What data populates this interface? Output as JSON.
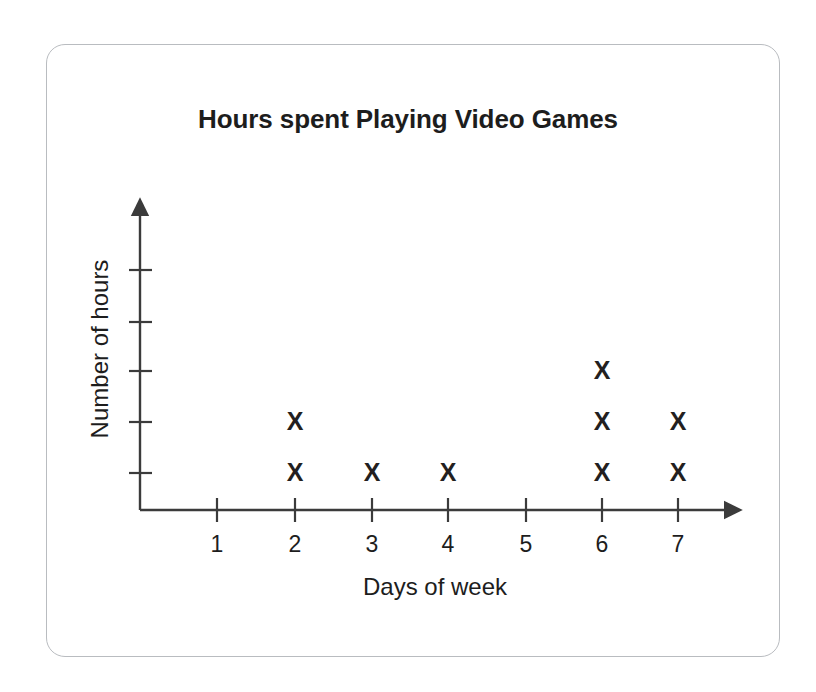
{
  "card": {
    "border_color": "#b9bcc0"
  },
  "chart_data": {
    "type": "scatter",
    "plot_style": "dot-plot-x-marks",
    "title": "Hours spent Playing Video Games",
    "xlabel": "Days of week",
    "ylabel": "Number of hours",
    "categories": [
      "1",
      "2",
      "3",
      "4",
      "5",
      "6",
      "7"
    ],
    "x": [
      1,
      2,
      3,
      4,
      5,
      6,
      7
    ],
    "values": [
      0,
      2,
      1,
      1,
      0,
      3,
      2
    ],
    "marker": "X",
    "marker_color": "#231f20",
    "axis_color": "#3b3b3b",
    "x_tick_labels": [
      "1",
      "2",
      "3",
      "4",
      "5",
      "6",
      "7"
    ],
    "y_tick_labels": [
      "",
      "",
      "",
      "",
      ""
    ],
    "y_tick_count": 5,
    "xlim": [
      0.5,
      7.6
    ],
    "ylim": [
      0,
      5
    ],
    "grid": false,
    "legend": false,
    "axis_arrows": [
      "x-right",
      "y-up"
    ]
  }
}
